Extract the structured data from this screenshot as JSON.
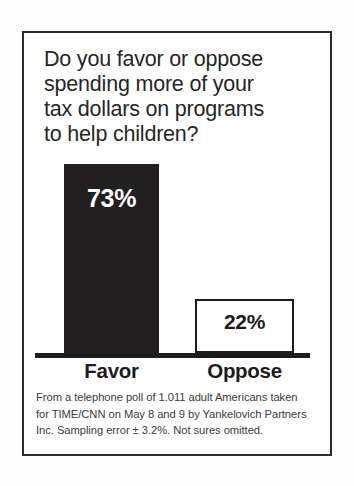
{
  "graphic": {
    "headline_lines": [
      "Do you favor or oppose",
      "spending more of your",
      "tax dollars on programs",
      "to help children?"
    ],
    "footnote_lines": [
      "From a telephone poll of 1.011 adult Americans taken",
      "for TIME/CNN on May 8 and 9 by Yankelovich Partners",
      "Inc. Sampling error ± 3.2%. Not sures omitted."
    ],
    "colors": {
      "bar_favor": "#231f20",
      "bar_oppose_fill": "#ffffff",
      "bar_oppose_stroke": "#1c1c1c",
      "frame": "#2b2b2b",
      "axis": "#1c1c1c",
      "text": "#262626",
      "background": "#ffffff"
    }
  },
  "chart_data": {
    "type": "bar",
    "title": "Do you favor or oppose spending more of your tax dollars on programs to help children?",
    "categories": [
      "Favor",
      "Oppose"
    ],
    "values": [
      73,
      22
    ],
    "value_labels": [
      "73%",
      "22%"
    ],
    "units": "percent",
    "xlabel": "",
    "ylabel": "",
    "ylim": [
      0,
      100
    ],
    "grid": false,
    "legend": false,
    "series": [
      {
        "name": "Response share",
        "values": [
          73,
          22
        ]
      }
    ],
    "annotations": [
      "From a telephone poll of 1.011 adult Americans taken for TIME/CNN on May 8 and 9 by Yankelovich Partners Inc. Sampling error ± 3.2%. Not sures omitted."
    ],
    "notes": {
      "sample_size": "1.011 adult Americans",
      "sponsor": "TIME/CNN",
      "field_dates": "May 8 and 9",
      "pollster": "Yankelovich Partners Inc.",
      "margin_of_error": "± 3.2%",
      "excluded": "Not sures omitted"
    }
  }
}
